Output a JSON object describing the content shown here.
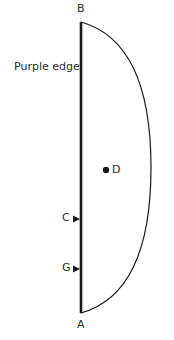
{
  "figure": {
    "background_color": "#ffffff",
    "stroke_color": "#1a1a1a",
    "label_color": "#2b2b2b",
    "width": 174,
    "height": 340,
    "labels": {
      "top_point": "B",
      "bottom_point": "A",
      "interior_point": "D",
      "marker_upper": "C",
      "marker_lower": "G",
      "edge_annotation": "Purple edge"
    },
    "geometry": {
      "chord_x": 81,
      "chord_top_y": 22,
      "chord_bottom_y": 313,
      "chord_stroke_width": 2.6,
      "arc_stroke_width": 1.2,
      "arc_rightmost_x": 151,
      "arc_mid_y": 167.5,
      "point_d_x": 106,
      "point_d_y": 170,
      "point_d_radius": 3.2,
      "marker_c_y": 219,
      "marker_g_y": 269,
      "marker_tip_x": 80,
      "marker_tail_x": 73,
      "marker_half_height": 3.4
    }
  }
}
